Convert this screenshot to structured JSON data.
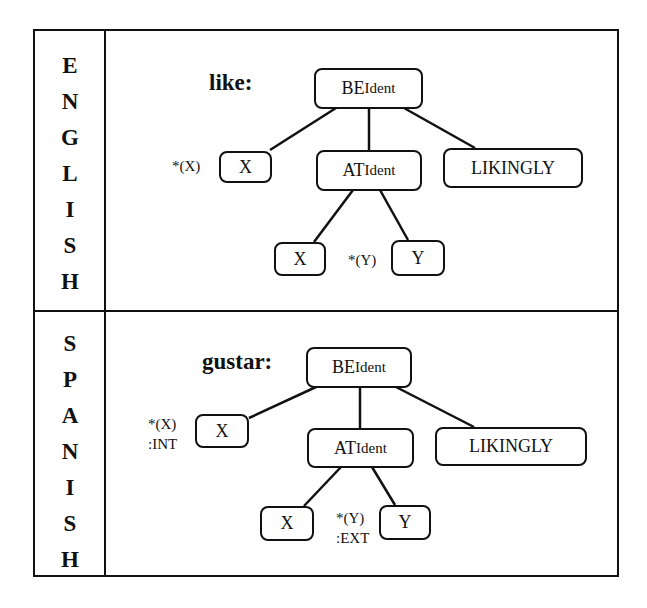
{
  "panels": [
    {
      "language_label": "ENGLISH",
      "letters": [
        "E",
        "N",
        "G",
        "L",
        "I",
        "S",
        "H"
      ],
      "verb": "like:",
      "nodes": {
        "root": {
          "label": "BE",
          "sub": "Ident"
        },
        "subject": {
          "label": "X",
          "annotation": "*(X)"
        },
        "at": {
          "label": "AT",
          "sub": "Ident"
        },
        "manner": {
          "label": "LIKINGLY"
        },
        "at_x": {
          "label": "X"
        },
        "at_y": {
          "label": "Y",
          "annotation": "*(Y)"
        }
      }
    },
    {
      "language_label": "SPANISH",
      "letters": [
        "S",
        "P",
        "A",
        "N",
        "I",
        "S",
        "H"
      ],
      "verb": "gustar:",
      "nodes": {
        "root": {
          "label": "BE",
          "sub": "Ident"
        },
        "subject": {
          "label": "X",
          "annotation": "*(X)",
          "annotation2": ":INT"
        },
        "at": {
          "label": "AT",
          "sub": "Ident"
        },
        "manner": {
          "label": "LIKINGLY"
        },
        "at_x": {
          "label": "X"
        },
        "at_y": {
          "label": "Y",
          "annotation": "*(Y)",
          "annotation2": ":EXT"
        }
      }
    }
  ]
}
